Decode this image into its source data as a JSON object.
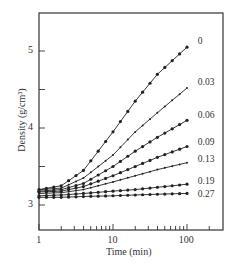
{
  "chart_data": {
    "type": "line",
    "title": "",
    "xlabel": "Time (min)",
    "ylabel": "Density (g/cm³)",
    "xscale": "log",
    "xlim": [
      1,
      230
    ],
    "ylim": [
      2.6,
      5.5
    ],
    "x_ticks": [
      1,
      10,
      100
    ],
    "x_tick_labels": [
      "1",
      "10",
      "100"
    ],
    "y_ticks": [
      3,
      4,
      5
    ],
    "y_tick_labels": [
      "3",
      "4",
      "5"
    ],
    "grid": false,
    "legend_position": "inline-right",
    "x": [
      1,
      2,
      4,
      10,
      20,
      40,
      100,
      120
    ],
    "series": [
      {
        "name": "0",
        "marker": "filled-circle",
        "values": [
          3.2,
          3.25,
          3.45,
          3.95,
          4.35,
          4.7,
          5.05,
          5.12
        ]
      },
      {
        "name": "0.03",
        "marker": "small-cross",
        "values": [
          3.2,
          3.22,
          3.35,
          3.65,
          3.95,
          4.2,
          4.52,
          4.58
        ]
      },
      {
        "name": "0.06",
        "marker": "filled-circle",
        "values": [
          3.18,
          3.2,
          3.28,
          3.5,
          3.7,
          3.88,
          4.1,
          4.15
        ]
      },
      {
        "name": "0.09",
        "marker": "filled-circle",
        "values": [
          3.17,
          3.18,
          3.24,
          3.38,
          3.5,
          3.62,
          3.76,
          3.8
        ]
      },
      {
        "name": "0.13",
        "marker": "small-cross",
        "values": [
          3.15,
          3.16,
          3.2,
          3.3,
          3.38,
          3.46,
          3.55,
          3.58
        ]
      },
      {
        "name": "0.19",
        "marker": "filled-circle",
        "values": [
          3.12,
          3.13,
          3.15,
          3.18,
          3.2,
          3.23,
          3.27,
          3.28
        ]
      },
      {
        "name": "0.27",
        "marker": "filled-circle",
        "values": [
          3.1,
          3.1,
          3.11,
          3.12,
          3.13,
          3.14,
          3.15,
          3.15
        ]
      }
    ]
  },
  "colors": {
    "line": "#222222",
    "axis": "#333333",
    "background": "#ffffff"
  }
}
